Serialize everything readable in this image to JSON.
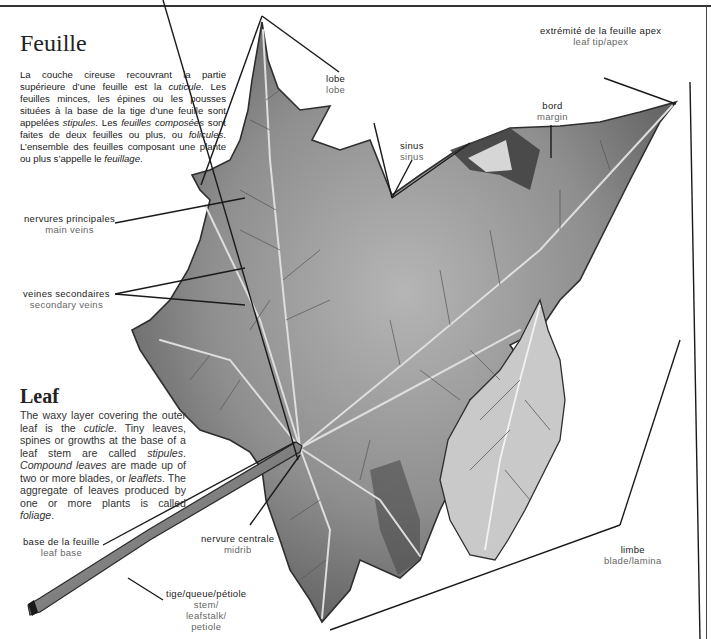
{
  "french": {
    "title": "Feuille",
    "paragraph": [
      {
        "t": "La couche cireuse recouvrant la partie supérieure d’une feuille est la "
      },
      {
        "t": "cuticule",
        "i": true
      },
      {
        "t": ". Les feuilles minces, les épines ou les pousses situées à la base de la tige d’une feuille sont appelées "
      },
      {
        "t": "stipules",
        "i": true
      },
      {
        "t": ". Les "
      },
      {
        "t": "feuilles composées",
        "i": true
      },
      {
        "t": " sont faites de deux feuilles ou plus, ou "
      },
      {
        "t": "folicules",
        "i": true
      },
      {
        "t": ". L’ensemble des feuilles composant une plante ou plus s’appelle le "
      },
      {
        "t": "feuillage",
        "i": true
      },
      {
        "t": "."
      }
    ]
  },
  "english": {
    "title": "Leaf",
    "paragraph": [
      {
        "t": "The waxy layer covering the outer leaf is the "
      },
      {
        "t": "cuticle",
        "i": true
      },
      {
        "t": ". Tiny leaves, spines or growths at the base of a leaf stem are called "
      },
      {
        "t": "stipules",
        "i": true
      },
      {
        "t": ". "
      },
      {
        "t": "Compound leaves",
        "i": true
      },
      {
        "t": " are made up of two or more blades, or "
      },
      {
        "t": "leaflets",
        "i": true
      },
      {
        "t": ". The aggregate of leaves produced by one or more plants is called "
      },
      {
        "t": "foliage",
        "i": true
      },
      {
        "t": "."
      }
    ]
  },
  "labels": {
    "lobe": {
      "fr": "lobe",
      "en": "lobe"
    },
    "apex": {
      "fr": "extrémité de la feuille apex",
      "en": "leaf  tip/apex"
    },
    "margin": {
      "fr": "bord",
      "en": "margin"
    },
    "sinus": {
      "fr": "sinus",
      "en": "sinus"
    },
    "main_veins": {
      "fr": "nervures  principales",
      "en": "main  veins"
    },
    "secondary_veins": {
      "fr": "veines  secondaires",
      "en": "secondary  veins"
    },
    "leaf_base": {
      "fr": "base  de  la  feuille",
      "en": "leaf  base"
    },
    "midrib": {
      "fr": "nervure  centrale",
      "en": "midrib"
    },
    "stem": {
      "fr": "tige/queue/pétiole",
      "en1": "stem/",
      "en2": "leafstalk/",
      "en3": "petiole"
    },
    "blade": {
      "fr": "limbe",
      "en": "blade/lamina"
    }
  },
  "colors": {
    "leaf_fill": "#8f8f8f",
    "leaf_dark": "#3a3a3a",
    "vein": "#d8d8d8",
    "leader": "#1a1a1a"
  }
}
